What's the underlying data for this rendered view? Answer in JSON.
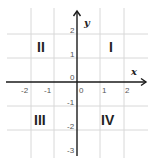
{
  "diagram": {
    "type": "cartesian-plane",
    "axis_labels": {
      "x": "x",
      "y": "y"
    },
    "x_ticks": [
      {
        "value": -2,
        "label": "-2"
      },
      {
        "value": -1,
        "label": "-1"
      },
      {
        "value": 0,
        "label": "0"
      },
      {
        "value": 1,
        "label": "1"
      },
      {
        "value": 2,
        "label": "2"
      }
    ],
    "y_ticks": [
      {
        "value": 2,
        "label": "2"
      },
      {
        "value": 1,
        "label": "1"
      },
      {
        "value": 0,
        "label": "0"
      },
      {
        "value": -1,
        "label": "-1"
      },
      {
        "value": -2,
        "label": "-2"
      },
      {
        "value": -3,
        "label": "-3"
      }
    ],
    "quadrants": [
      {
        "id": "I",
        "label": "I"
      },
      {
        "id": "II",
        "label": "II"
      },
      {
        "id": "III",
        "label": "III"
      },
      {
        "id": "IV",
        "label": "IV"
      }
    ],
    "colors": {
      "grid": "#d8d8d8",
      "axis": "#1a1a1a",
      "text": "#222222"
    }
  }
}
